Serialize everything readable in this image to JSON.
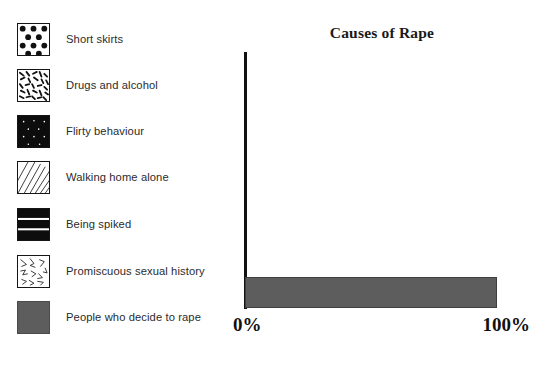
{
  "chart_data": {
    "type": "bar",
    "orientation": "horizontal",
    "title": "Causes of Rape",
    "xlabel": "",
    "ylabel": "",
    "xlim": [
      0,
      100
    ],
    "xtick_labels": [
      "0%",
      "100%"
    ],
    "grid": false,
    "legend_position": "left",
    "categories": [
      "Short skirts",
      "Drugs and alcohol",
      "Flirty behaviour",
      "Walking home alone",
      "Being spiked",
      "Promiscuous sexual history",
      "People who decide to rape"
    ],
    "values": [
      0,
      0,
      0,
      0,
      0,
      0,
      100
    ],
    "units": "percent",
    "bar_color": "#5d5d5d"
  },
  "title": "Causes of Rape",
  "axis": {
    "min_label": "0%",
    "max_label": "100%"
  },
  "legend": {
    "items": [
      {
        "label": "Short skirts",
        "pattern": "polka-dots",
        "fill": "#ffffff",
        "ink": "#111111"
      },
      {
        "label": "Drugs and alcohol",
        "pattern": "confetti-dashes",
        "fill": "#ffffff",
        "ink": "#111111"
      },
      {
        "label": "Flirty behaviour",
        "pattern": "dotted-on-black",
        "fill": "#0d0d0d",
        "ink": "#ffffff"
      },
      {
        "label": "Walking home alone",
        "pattern": "diagonal-hatch",
        "fill": "#ffffff",
        "ink": "#111111"
      },
      {
        "label": "Being spiked",
        "pattern": "horizontal-stripes",
        "fill": "#0d0d0d",
        "ink": "#ffffff"
      },
      {
        "label": "Promiscuous sexual history",
        "pattern": "sparse-zigzag",
        "fill": "#ffffff",
        "ink": "#111111"
      },
      {
        "label": "People who decide to rape",
        "pattern": "solid-gray",
        "fill": "#5d5d5d",
        "ink": "#5d5d5d"
      }
    ]
  }
}
